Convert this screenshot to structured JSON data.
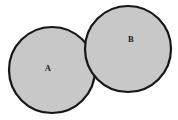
{
  "figure": {
    "name": "two-circles-diagram",
    "width": 178,
    "height": 120,
    "background_color": "#ffffff",
    "style": {
      "fill_color": "#c8c8c8",
      "stroke_color": "#161616",
      "stroke_width": 2.2,
      "label_color": "#1b1b1b",
      "label_font_size": 8.5
    },
    "shapes": [
      {
        "id": "circle-a",
        "label": "A",
        "cx": 52,
        "cy": 70,
        "r": 43,
        "label_x": 48,
        "label_y": 69
      },
      {
        "id": "circle-b",
        "label": "B",
        "cx": 128,
        "cy": 49,
        "r": 43,
        "label_x": 131,
        "label_y": 40
      }
    ]
  }
}
